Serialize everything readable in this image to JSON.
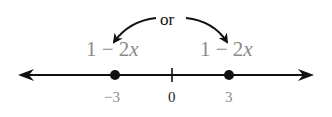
{
  "diagram": {
    "connector_label": "or",
    "expressions": [
      {
        "text_prefix": "1 − 2",
        "variable": "x",
        "attached_to": "-3"
      },
      {
        "text_prefix": "1 − 2",
        "variable": "x",
        "attached_to": "3"
      }
    ],
    "number_line": {
      "points": [
        {
          "label": "−3",
          "value": -3,
          "marked": true
        },
        {
          "label": "0",
          "value": 0,
          "marked": false,
          "tick": true
        },
        {
          "label": "3",
          "value": 3,
          "marked": true
        }
      ],
      "arrows": "both"
    }
  }
}
